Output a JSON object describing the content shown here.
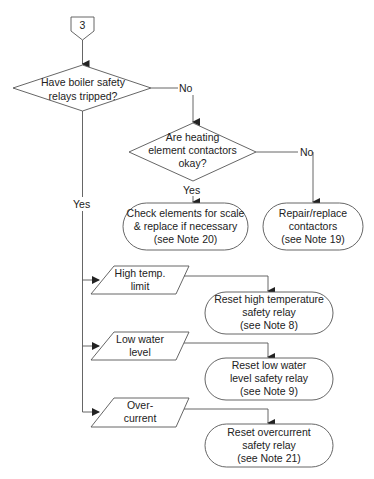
{
  "diagram": {
    "type": "flowchart",
    "connector": {
      "label": "3"
    },
    "decisions": [
      {
        "id": "d1",
        "text": "Have boiler safety\nrelays tripped?"
      },
      {
        "id": "d2",
        "text": "Are heating\nelement contactors\nokay?"
      }
    ],
    "edge_labels": {
      "d1_no": "No",
      "d1_yes": "Yes",
      "d2_no": "No",
      "d2_yes": "Yes"
    },
    "inputs": [
      {
        "id": "i1",
        "text": "High temp.\nlimit"
      },
      {
        "id": "i2",
        "text": "Low water\nlevel"
      },
      {
        "id": "i3",
        "text": "Over-\ncurrent"
      }
    ],
    "terminals": [
      {
        "id": "t1",
        "text": "Check elements for scale\n& replace if necessary\n(see Note 20)"
      },
      {
        "id": "t2",
        "text": "Repair/replace\ncontactors\n(see Note 19)"
      },
      {
        "id": "t3",
        "text": "Reset high temperature\nsafety relay\n(see Note 8)"
      },
      {
        "id": "t4",
        "text": "Reset low water\nlevel safety relay\n(see Note 9)"
      },
      {
        "id": "t5",
        "text": "Reset overcurrent\nsafety relay\n(see Note 21)"
      }
    ],
    "colors": {
      "stroke": "#555555",
      "text": "#222222",
      "background": "#ffffff"
    }
  }
}
